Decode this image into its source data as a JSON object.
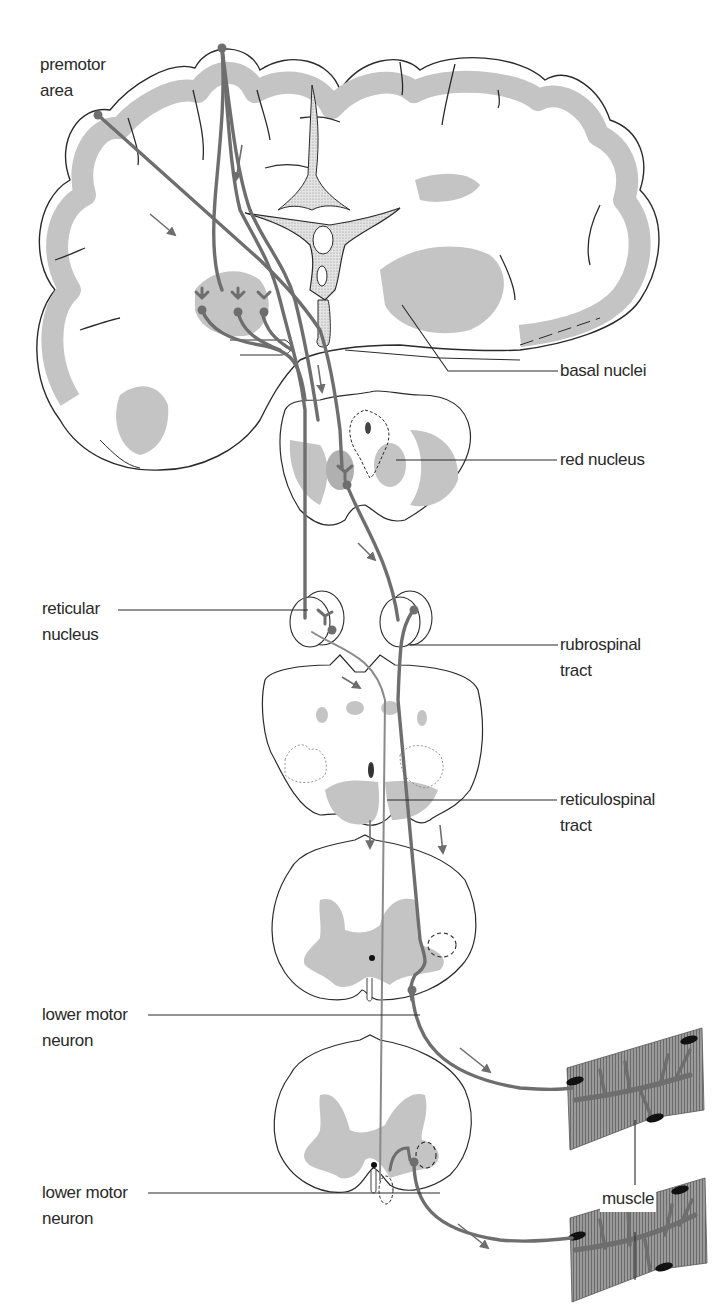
{
  "diagram": {
    "colors": {
      "background": "#ffffff",
      "outline": "#2a2a2a",
      "gray_matter": "#c4c4c4",
      "stipple": "#9a9a9a",
      "pathway": "#6e6e6e",
      "muscle": "#8a8a8a",
      "muscle_nuclei": "#111111"
    },
    "structures": [
      "cerebrum-coronal-section",
      "midbrain-section",
      "reticular-nuclei-pons",
      "medulla-section",
      "cervical-spinal-cord-section",
      "lumbar-spinal-cord-section",
      "muscle-fiber-upper",
      "muscle-fiber-lower"
    ]
  },
  "labels": {
    "premotor_area": [
      "premotor",
      "area"
    ],
    "basal_nuclei": [
      "basal nuclei"
    ],
    "red_nucleus": [
      "red nucleus"
    ],
    "reticular_nucleus": [
      "reticular",
      "nucleus"
    ],
    "rubrospinal_tract": [
      "rubrospinal",
      "tract"
    ],
    "reticulospinal_tract": [
      "reticulospinal",
      "tract"
    ],
    "lower_motor_neuron_1": [
      "lower motor",
      "neuron"
    ],
    "lower_motor_neuron_2": [
      "lower motor",
      "neuron"
    ],
    "muscle": [
      "muscle"
    ]
  }
}
